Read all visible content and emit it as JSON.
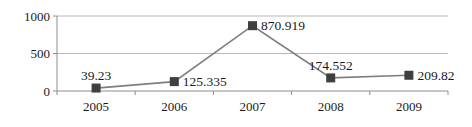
{
  "chart_data": {
    "type": "line",
    "title": "",
    "categories": [
      "2005",
      "2006",
      "2007",
      "2008",
      "2009"
    ],
    "series": [
      {
        "name": "",
        "values": [
          39.23,
          125.335,
          870.919,
          174.552,
          209.82
        ],
        "marker": "square",
        "line_color": "#7f7f7f",
        "marker_color": "#3f3f3f"
      }
    ],
    "data_labels": [
      {
        "text": "39.23",
        "position": "above"
      },
      {
        "text": "125.335",
        "position": "right"
      },
      {
        "text": "870.919",
        "position": "right"
      },
      {
        "text": "174.552",
        "position": "above"
      },
      {
        "text": "209.82",
        "position": "right"
      }
    ],
    "xlabel": "",
    "ylabel": "",
    "ylim": [
      0,
      1000
    ],
    "yticks": [
      0,
      500,
      1000
    ],
    "ytick_labels": [
      "0",
      "500",
      "1000"
    ],
    "grid": true,
    "legend": "none",
    "colors": {
      "grid": "#b8b8b8",
      "axis": "#8e8e8e",
      "text": "#1a1a1a",
      "background": "#ffffff"
    }
  }
}
